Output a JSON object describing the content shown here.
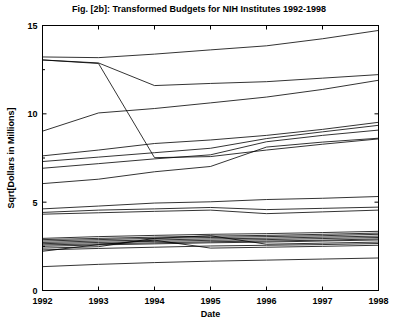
{
  "chart_data": {
    "type": "line",
    "title": "Fig. [2b]: Transformed Budgets for NIH Institutes 1992-1998",
    "xlabel": "Date",
    "ylabel": "Sqrt[Dollars in Millions]",
    "x": [
      1992,
      1993,
      1994,
      1995,
      1996,
      1997,
      1998
    ],
    "xlim": [
      1992,
      1998
    ],
    "ylim": [
      0,
      15
    ],
    "xticks": [
      1992,
      1993,
      1994,
      1995,
      1996,
      1997,
      1998
    ],
    "xtick_labels": [
      "1992",
      "1993",
      "1994",
      "1995",
      "1996",
      "1997",
      "1998"
    ],
    "yticks": [
      0,
      5,
      10,
      15
    ],
    "ytick_labels": [
      "0",
      "5",
      "10",
      "15"
    ],
    "grid": false,
    "legend": "none",
    "line_color": "#000000",
    "series": [
      {
        "name": "NCI",
        "values": [
          13.22,
          13.18,
          13.38,
          13.62,
          13.85,
          14.25,
          14.72
        ]
      },
      {
        "name": "NHLBI",
        "values": [
          13.05,
          12.88,
          11.6,
          11.72,
          11.82,
          12.02,
          12.22
        ]
      },
      {
        "name": "NIAID",
        "values": [
          9.02,
          10.05,
          10.3,
          10.62,
          10.95,
          11.38,
          11.9
        ]
      },
      {
        "name": "NIDDK",
        "values": [
          7.62,
          7.95,
          8.32,
          8.52,
          8.78,
          9.12,
          9.52
        ]
      },
      {
        "name": "NIGMS",
        "values": [
          7.3,
          7.55,
          7.8,
          8.05,
          8.6,
          8.98,
          9.35
        ]
      },
      {
        "name": "NINDS",
        "values": [
          6.92,
          7.18,
          7.45,
          7.68,
          8.42,
          8.78,
          9.08
        ]
      },
      {
        "name": "NICHD",
        "values": [
          6.05,
          6.3,
          6.72,
          7.02,
          8.12,
          8.4,
          8.62
        ]
      },
      {
        "name": "NIMH-transfer",
        "values": [
          13.05,
          12.85,
          7.52,
          7.58,
          7.95,
          8.28,
          8.58
        ]
      },
      {
        "name": "NIEHS",
        "values": [
          4.62,
          4.78,
          4.95,
          5.02,
          5.15,
          5.22,
          5.32
        ]
      },
      {
        "name": "NIA",
        "values": [
          4.42,
          4.55,
          4.62,
          4.7,
          4.58,
          4.65,
          4.72
        ]
      },
      {
        "name": "NIAMS",
        "values": [
          4.32,
          4.4,
          4.48,
          4.55,
          4.35,
          4.45,
          4.55
        ]
      },
      {
        "name": "NEI",
        "values": [
          2.95,
          3.05,
          3.12,
          3.18,
          3.22,
          3.28,
          3.35
        ]
      },
      {
        "name": "NIDCD",
        "values": [
          2.88,
          2.95,
          3.02,
          3.08,
          3.12,
          3.18,
          3.25
        ]
      },
      {
        "name": "NIDCR",
        "values": [
          2.8,
          2.88,
          2.95,
          3.0,
          3.05,
          3.1,
          3.18
        ]
      },
      {
        "name": "NIAAA",
        "values": [
          2.72,
          2.8,
          2.86,
          2.92,
          2.96,
          3.02,
          3.08
        ]
      },
      {
        "name": "NIDA",
        "values": [
          2.65,
          2.72,
          2.78,
          2.84,
          2.88,
          2.94,
          3.0
        ]
      },
      {
        "name": "NINR",
        "values": [
          2.58,
          2.64,
          2.7,
          2.76,
          2.8,
          2.85,
          2.92
        ]
      },
      {
        "name": "NHGRI",
        "values": [
          2.5,
          2.58,
          2.64,
          2.7,
          2.74,
          2.8,
          2.86
        ]
      },
      {
        "name": "NCRR",
        "values": [
          2.4,
          2.48,
          2.95,
          3.1,
          2.62,
          2.68,
          2.74
        ]
      },
      {
        "name": "NLM",
        "values": [
          2.3,
          2.38,
          2.45,
          2.52,
          2.56,
          2.6,
          2.66
        ]
      },
      {
        "name": "FIC",
        "values": [
          2.22,
          2.6,
          2.85,
          2.4,
          2.45,
          2.5,
          2.56
        ]
      },
      {
        "name": "NIBIB",
        "values": [
          1.35,
          1.48,
          1.58,
          1.66,
          1.72,
          1.78,
          1.84
        ]
      }
    ]
  }
}
